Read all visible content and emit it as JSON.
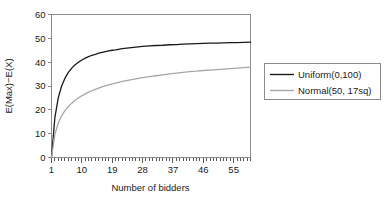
{
  "chart_data": {
    "type": "line",
    "title": "",
    "subtitle": "",
    "xlabel": "Number of bidders",
    "ylabel": "E(Max)−E(X)",
    "xlim": [
      1,
      60
    ],
    "ylim": [
      0,
      60
    ],
    "grid": false,
    "legend_position": "right-outside",
    "xticks": [
      1,
      10,
      19,
      28,
      37,
      46,
      55
    ],
    "xtick_labels": [
      "1",
      "10",
      "19",
      "28",
      "37",
      "46",
      "55"
    ],
    "yticks": [
      0,
      10,
      20,
      30,
      40,
      50,
      60
    ],
    "ytick_labels": [
      "0",
      "10",
      "20",
      "30",
      "40",
      "50",
      "60"
    ],
    "x": [
      1,
      2,
      3,
      4,
      5,
      6,
      7,
      8,
      9,
      10,
      11,
      12,
      13,
      14,
      15,
      16,
      17,
      18,
      19,
      20,
      22,
      24,
      26,
      28,
      30,
      32,
      34,
      36,
      38,
      40,
      42,
      44,
      46,
      48,
      50,
      52,
      54,
      56,
      58,
      60
    ],
    "series": [
      {
        "name": "Uniform(0,100)",
        "color": "#1a1a1a",
        "values": [
          0,
          16.7,
          25,
          30,
          33.3,
          35.7,
          37.5,
          38.9,
          40,
          40.9,
          41.7,
          42.3,
          42.9,
          43.3,
          43.8,
          44.1,
          44.4,
          44.7,
          45,
          45.2,
          45.7,
          46,
          46.3,
          46.6,
          46.8,
          47,
          47.1,
          47.3,
          47.4,
          47.6,
          47.7,
          47.8,
          47.9,
          48,
          48,
          48.1,
          48.2,
          48.2,
          48.3,
          48.4
        ]
      },
      {
        "name": "Normal(50, 17sq)",
        "color": "#a6a6a6",
        "values": [
          0,
          9.6,
          14.5,
          17.5,
          19.7,
          21.4,
          22.8,
          24.0,
          25.0,
          25.9,
          26.7,
          27.4,
          28.0,
          28.6,
          29.1,
          29.6,
          30.1,
          30.5,
          30.9,
          31.2,
          31.9,
          32.5,
          33.0,
          33.5,
          33.9,
          34.3,
          34.7,
          35.1,
          35.4,
          35.7,
          36.0,
          36.2,
          36.5,
          36.7,
          36.9,
          37.1,
          37.3,
          37.5,
          37.7,
          37.9
        ]
      }
    ],
    "legend": [
      {
        "label": "Uniform(0,100)",
        "color": "#1a1a1a"
      },
      {
        "label": "Normal(50, 17sq)",
        "color": "#a6a6a6"
      }
    ]
  },
  "axes": {
    "y_title": "E(Max)−E(X)",
    "x_title": "Number of bidders"
  }
}
